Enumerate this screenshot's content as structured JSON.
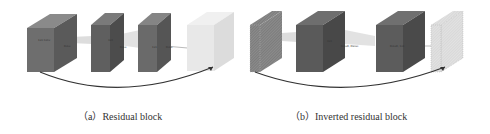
{
  "figure": {
    "panels": [
      {
        "id": "a",
        "caption": "（a）Residual block",
        "layers": [
          {
            "name": "input",
            "fill": "#6e6e6e"
          },
          {
            "name": "conv-3x3",
            "fill": "#5f5f5f"
          },
          {
            "name": "conv-1x1",
            "fill": "#6a6a6a"
          },
          {
            "name": "output",
            "fill": "#e8e8e8"
          }
        ],
        "labels": [
          "1x1 Conv",
          "ReLu",
          "3x3",
          "ReLu",
          "1x1",
          "ReLu"
        ],
        "skip_connection": "+"
      },
      {
        "id": "b",
        "caption": "（b）Inverted residual block",
        "layers": [
          {
            "name": "input-thin-hatched",
            "fill": "#8a8a8a"
          },
          {
            "name": "expansion",
            "fill": "#5a5a5a"
          },
          {
            "name": "depthwise",
            "fill": "#5c5c5c"
          },
          {
            "name": "output-thin-hatched",
            "fill": "#e4e4e4"
          }
        ],
        "labels": [
          "3x3",
          "ReLu6, Dwise",
          "ReLu6, 1x1"
        ],
        "skip_connection": "+"
      }
    ]
  }
}
